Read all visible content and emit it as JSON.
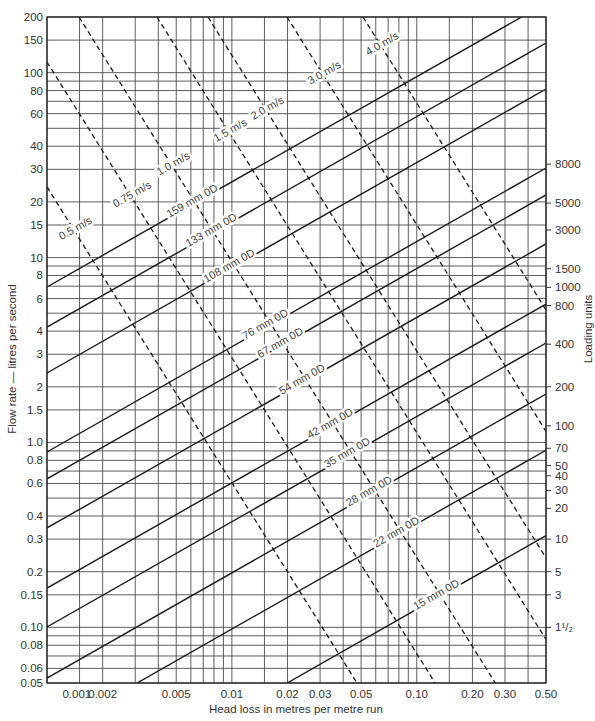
{
  "chart_data": {
    "type": "line",
    "title": "",
    "xlabel": "Head loss in metres per metre run",
    "ylabel": "Flow rate — litres per second",
    "y2label": "Loading units",
    "xscale": "log",
    "yscale": "log",
    "xlim": [
      0.001,
      0.5
    ],
    "ylim": [
      0.05,
      200
    ],
    "grid": true,
    "legend": "none (lines labelled inline)",
    "x_gridlines": [
      0.001,
      0.0015,
      0.002,
      0.003,
      0.004,
      0.005,
      0.006,
      0.007,
      0.008,
      0.009,
      0.01,
      0.015,
      0.02,
      0.03,
      0.04,
      0.05,
      0.06,
      0.07,
      0.08,
      0.09,
      0.1,
      0.15,
      0.2,
      0.3,
      0.4,
      0.5
    ],
    "y_gridlines": [
      0.05,
      0.06,
      0.07,
      0.08,
      0.09,
      0.1,
      0.15,
      0.2,
      0.3,
      0.4,
      0.5,
      0.6,
      0.7,
      0.8,
      0.9,
      1,
      1.5,
      2,
      3,
      4,
      5,
      6,
      7,
      8,
      9,
      10,
      15,
      20,
      30,
      40,
      50,
      60,
      70,
      80,
      90,
      100,
      150,
      200
    ],
    "x_tick_labels": [
      {
        "text": "0.001",
        "value": 0.00145
      },
      {
        "text": "0.002",
        "value": 0.002
      },
      {
        "text": "0.005",
        "value": 0.005
      },
      {
        "text": "0.01",
        "value": 0.01
      },
      {
        "text": "0.02",
        "value": 0.02
      },
      {
        "text": "0.03",
        "value": 0.03
      },
      {
        "text": "0.05",
        "value": 0.05
      },
      {
        "text": "0.10",
        "value": 0.1
      },
      {
        "text": "0.20",
        "value": 0.2
      },
      {
        "text": "0.30",
        "value": 0.3
      },
      {
        "text": "0.50",
        "value": 0.5
      }
    ],
    "y_tick_labels": [
      {
        "text": "200",
        "value": 200
      },
      {
        "text": "150",
        "value": 150
      },
      {
        "text": "100",
        "value": 100
      },
      {
        "text": "80",
        "value": 80
      },
      {
        "text": "60",
        "value": 60
      },
      {
        "text": "40",
        "value": 40
      },
      {
        "text": "30",
        "value": 30
      },
      {
        "text": "20",
        "value": 20
      },
      {
        "text": "15",
        "value": 15
      },
      {
        "text": "10",
        "value": 10
      },
      {
        "text": "8",
        "value": 8
      },
      {
        "text": "6",
        "value": 6
      },
      {
        "text": "4",
        "value": 4
      },
      {
        "text": "3",
        "value": 3
      },
      {
        "text": "2",
        "value": 2
      },
      {
        "text": "1.5",
        "value": 1.5
      },
      {
        "text": "1.0",
        "value": 1.0
      },
      {
        "text": "0.8",
        "value": 0.8
      },
      {
        "text": "0.6",
        "value": 0.6
      },
      {
        "text": "0.4",
        "value": 0.4
      },
      {
        "text": "0.3",
        "value": 0.3
      },
      {
        "text": "0.2",
        "value": 0.2
      },
      {
        "text": "0.15",
        "value": 0.15
      },
      {
        "text": "0.10",
        "value": 0.1
      },
      {
        "text": "0.08",
        "value": 0.08
      },
      {
        "text": "0.06",
        "value": 0.06
      },
      {
        "text": "0.05",
        "value": 0.05
      }
    ],
    "y2_ticks": [
      {
        "text": "8000",
        "flow": 32
      },
      {
        "text": "5000",
        "flow": 19.7
      },
      {
        "text": "3000",
        "flow": 14.1
      },
      {
        "text": "1500",
        "flow": 8.7
      },
      {
        "text": "1000",
        "flow": 6.9
      },
      {
        "text": "800",
        "flow": 5.5
      },
      {
        "text": "400",
        "flow": 3.4
      },
      {
        "text": "200",
        "flow": 2.0
      },
      {
        "text": "100",
        "flow": 1.23
      },
      {
        "text": "70",
        "flow": 0.93
      },
      {
        "text": "50",
        "flow": 0.75
      },
      {
        "text": "40",
        "flow": 0.66
      },
      {
        "text": "30",
        "flow": 0.55
      },
      {
        "text": "20",
        "flow": 0.44
      },
      {
        "text": "10",
        "flow": 0.3
      },
      {
        "text": "5",
        "flow": 0.2
      },
      {
        "text": "3",
        "flow": 0.15
      },
      {
        "text": "1¹/₂",
        "flow": 0.1
      }
    ],
    "series": [
      {
        "name": "159 mm 0D",
        "group": "pipe",
        "style": "solid",
        "points": [
          [
            0.001,
            6.93
          ],
          [
            0.369,
            200
          ]
        ],
        "label_at": 0.00608
      },
      {
        "name": "133 mm 0D",
        "group": "pipe",
        "style": "solid",
        "points": [
          [
            0.001,
            4.21
          ],
          [
            0.5,
            144.6
          ]
        ],
        "label_at": 0.00771
      },
      {
        "name": "108 mm 0D",
        "group": "pipe",
        "style": "solid",
        "points": [
          [
            0.001,
            2.375
          ],
          [
            0.5,
            81.6
          ]
        ],
        "label_at": 0.00965
      },
      {
        "name": "76 mm 0D",
        "group": "pipe",
        "style": "solid",
        "points": [
          [
            0.001,
            0.888
          ],
          [
            0.5,
            30.5
          ]
        ],
        "label_at": 0.0151
      },
      {
        "name": "67 mm 0D",
        "group": "pipe",
        "style": "solid",
        "points": [
          [
            0.001,
            0.635
          ],
          [
            0.5,
            21.8
          ]
        ],
        "label_at": 0.0182
      },
      {
        "name": "54 mm 0D",
        "group": "pipe",
        "style": "solid",
        "points": [
          [
            0.001,
            0.345
          ],
          [
            0.5,
            11.85
          ]
        ],
        "label_at": 0.0239
      },
      {
        "name": "42 mm 0D",
        "group": "pipe",
        "style": "solid",
        "points": [
          [
            0.001,
            0.163
          ],
          [
            0.5,
            5.6
          ]
        ],
        "label_at": 0.0339
      },
      {
        "name": "35 mm 0D",
        "group": "pipe",
        "style": "solid",
        "points": [
          [
            0.001,
            0.1005
          ],
          [
            0.5,
            3.45
          ]
        ],
        "label_at": 0.0419
      },
      {
        "name": "28 mm 0D",
        "group": "pipe",
        "style": "solid",
        "points": [
          [
            0.001,
            0.0532
          ],
          [
            0.5,
            1.827
          ]
        ],
        "label_at": 0.0551
      },
      {
        "name": "22 mm 0D",
        "group": "pipe",
        "style": "solid",
        "points": [
          [
            0.00307,
            0.05
          ],
          [
            0.5,
            0.907
          ]
        ],
        "label_at": 0.0772
      },
      {
        "name": "15 mm 0D",
        "group": "pipe",
        "style": "solid",
        "points": [
          [
            0.0199,
            0.05
          ],
          [
            0.5,
            0.3135
          ]
        ],
        "label_at": 0.127
      },
      {
        "name": "0.5 m/s",
        "group": "velocity",
        "style": "dashed",
        "points": [
          [
            0.001,
            24.1
          ],
          [
            0.0475,
            0.05
          ]
        ],
        "label_at": 0.00142
      },
      {
        "name": "0.75 m/s",
        "group": "velocity",
        "style": "dashed",
        "points": [
          [
            0.001,
            114.2
          ],
          [
            0.1257,
            0.05
          ]
        ],
        "label_at": 0.00288
      },
      {
        "name": "1.0 m/s",
        "group": "velocity",
        "style": "dashed",
        "points": [
          [
            0.00149,
            200
          ],
          [
            0.2658,
            0.05
          ]
        ],
        "label_at": 0.0048
      },
      {
        "name": "1.5 m/s",
        "group": "velocity",
        "style": "dashed",
        "points": [
          [
            0.003934,
            200
          ],
          [
            0.5,
            0.086
          ]
        ],
        "label_at": 0.00977
      },
      {
        "name": "2.0 m/s",
        "group": "velocity",
        "style": "dashed",
        "points": [
          [
            0.007425,
            200
          ],
          [
            0.5,
            0.2375
          ]
        ],
        "label_at": 0.0155
      },
      {
        "name": "3.0 m/s",
        "group": "velocity",
        "style": "dashed",
        "points": [
          [
            0.01986,
            200
          ],
          [
            0.5,
            1.147
          ]
        ],
        "label_at": 0.0315
      },
      {
        "name": "4.0  m/s",
        "group": "velocity",
        "style": "dashed",
        "points": [
          [
            0.05117,
            200
          ],
          [
            0.5,
            5.21
          ]
        ],
        "label_at": 0.0648
      }
    ]
  }
}
